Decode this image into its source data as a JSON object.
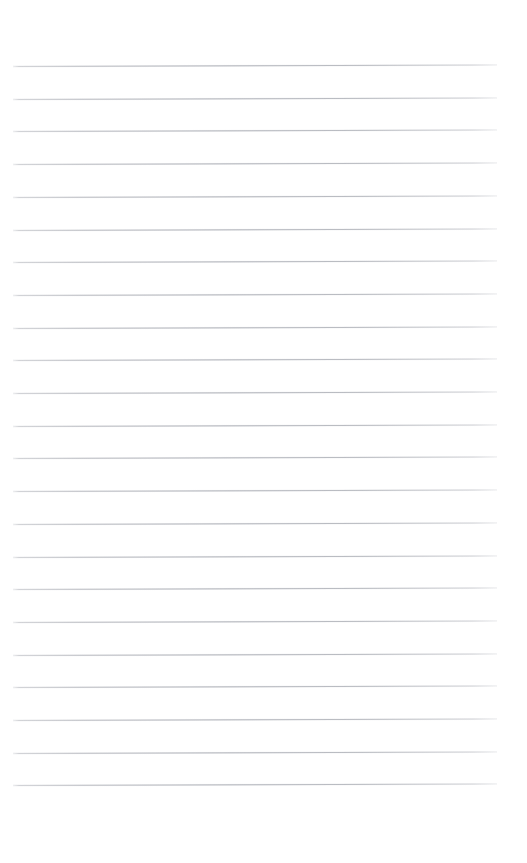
{
  "page": {
    "kind": "ruled-notebook-page",
    "width": 527,
    "height": 863,
    "background_color": "#ffffff",
    "text_content": "",
    "has_text": false,
    "has_header": false,
    "has_footer": false,
    "has_page_number": false
  },
  "rules": {
    "count": 23,
    "color": "#a0a3ab",
    "thickness_px": 1,
    "first_line_y": 66,
    "line_spacing_px": 32.7,
    "left_margin_x": 13,
    "right_margin_x": 497,
    "line_length_px": 484,
    "slant_degrees": -0.18,
    "top_blank_px": 66,
    "bottom_blank_px": 73,
    "y_positions": [
      66,
      98.7,
      131.4,
      164.1,
      196.8,
      229.5,
      262.2,
      294.9,
      327.6,
      360.3,
      393.0,
      425.7,
      458.4,
      491.1,
      523.8,
      556.5,
      589.2,
      621.9,
      654.6,
      687.3,
      720.0,
      752.7,
      785.4
    ],
    "line_labels": [
      "rule-line-1",
      "rule-line-2",
      "rule-line-3",
      "rule-line-4",
      "rule-line-5",
      "rule-line-6",
      "rule-line-7",
      "rule-line-8",
      "rule-line-9",
      "rule-line-10",
      "rule-line-11",
      "rule-line-12",
      "rule-line-13",
      "rule-line-14",
      "rule-line-15",
      "rule-line-16",
      "rule-line-17",
      "rule-line-18",
      "rule-line-19",
      "rule-line-20",
      "rule-line-21",
      "rule-line-22",
      "rule-line-23"
    ]
  }
}
